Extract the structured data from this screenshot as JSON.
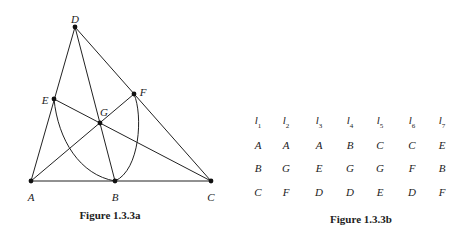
{
  "figure_a": {
    "caption": "Figure 1.3.3a",
    "points": [
      {
        "name": "A",
        "x": 31,
        "y": 181,
        "lx": 31,
        "ly": 197
      },
      {
        "name": "B",
        "x": 115,
        "y": 181,
        "lx": 115,
        "ly": 197
      },
      {
        "name": "C",
        "x": 211,
        "y": 181,
        "lx": 211,
        "ly": 197
      },
      {
        "name": "D",
        "x": 75,
        "y": 27,
        "lx": 75,
        "ly": 19
      },
      {
        "name": "E",
        "x": 54,
        "y": 99,
        "lx": 45,
        "ly": 100
      },
      {
        "name": "F",
        "x": 134,
        "y": 94,
        "lx": 143,
        "ly": 92
      },
      {
        "name": "G",
        "x": 100,
        "y": 123,
        "lx": 104,
        "ly": 112
      }
    ],
    "lines": [
      [
        "A",
        "C"
      ],
      [
        "A",
        "D"
      ],
      [
        "D",
        "C"
      ],
      [
        "D",
        "B"
      ],
      [
        "E",
        "C"
      ],
      [
        "A",
        "F"
      ]
    ]
  },
  "figure_b": {
    "caption": "Figure 1.3.3b",
    "headers": [
      {
        "base": "l",
        "sub": "1"
      },
      {
        "base": "l",
        "sub": "2"
      },
      {
        "base": "l",
        "sub": "3"
      },
      {
        "base": "l",
        "sub": "4"
      },
      {
        "base": "l",
        "sub": "5"
      },
      {
        "base": "l",
        "sub": "6"
      },
      {
        "base": "l",
        "sub": "7"
      }
    ],
    "rows": [
      [
        "A",
        "A",
        "A",
        "B",
        "C",
        "C",
        "E"
      ],
      [
        "B",
        "G",
        "E",
        "G",
        "G",
        "F",
        "B"
      ],
      [
        "C",
        "F",
        "D",
        "D",
        "E",
        "D",
        "F"
      ]
    ]
  }
}
